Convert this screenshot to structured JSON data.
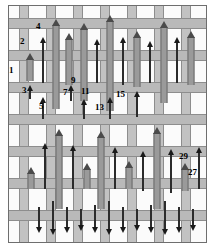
{
  "figure": {
    "title": "",
    "type": "patent-drawing",
    "canvas": {
      "width": 213,
      "height": 246
    },
    "colors": {
      "background": "#ffffff",
      "plate": "#f2f2f2",
      "cell": "#fbfbfb",
      "horizontal_band": "#b9b9b9",
      "vertical_band": "#c2c2c2",
      "band_outline": "#8d8d8d",
      "arrow_dark": "#2b2b2b",
      "arrow_tube": "#9a9a9a",
      "label_text": "#000000",
      "frame": "#6e6e6e"
    }
  },
  "grid": {
    "horizontal_band_tops": [
      12,
      44,
      76,
      108,
      140,
      172,
      204
    ],
    "horizontal_band_height": 11,
    "vertical_band_lefts": [
      10,
      37,
      64,
      91,
      118,
      145,
      172
    ],
    "vertical_band_width": 10
  },
  "arrows": [
    {
      "id": "a1",
      "x": 21,
      "top": 52,
      "height": 28,
      "style": "tube"
    },
    {
      "id": "a2",
      "x": 34,
      "top": 36,
      "height": 46,
      "style": "dark"
    },
    {
      "id": "a3",
      "x": 21,
      "top": 84,
      "height": 14,
      "style": "dark"
    },
    {
      "id": "a4",
      "x": 47,
      "top": 18,
      "height": 90,
      "style": "tube"
    },
    {
      "id": "a5",
      "x": 34,
      "top": 96,
      "height": 22,
      "style": "dark"
    },
    {
      "id": "a6",
      "x": 60,
      "top": 32,
      "height": 52,
      "style": "tube"
    },
    {
      "id": "a7",
      "x": 62,
      "top": 84,
      "height": 16,
      "style": "dark"
    },
    {
      "id": "a8",
      "x": 75,
      "top": 22,
      "height": 78,
      "style": "tube"
    },
    {
      "id": "a9",
      "x": 88,
      "top": 38,
      "height": 44,
      "style": "dark"
    },
    {
      "id": "a10",
      "x": 75,
      "top": 98,
      "height": 20,
      "style": "dark"
    },
    {
      "id": "a11",
      "x": 101,
      "top": 14,
      "height": 96,
      "style": "tube"
    },
    {
      "id": "a12",
      "x": 114,
      "top": 36,
      "height": 48,
      "style": "dark"
    },
    {
      "id": "a13",
      "x": 101,
      "top": 96,
      "height": 22,
      "style": "dark"
    },
    {
      "id": "a14",
      "x": 128,
      "top": 30,
      "height": 56,
      "style": "tube"
    },
    {
      "id": "a15",
      "x": 141,
      "top": 40,
      "height": 42,
      "style": "dark"
    },
    {
      "id": "a16",
      "x": 128,
      "top": 90,
      "height": 26,
      "style": "dark"
    },
    {
      "id": "a17",
      "x": 155,
      "top": 20,
      "height": 82,
      "style": "tube"
    },
    {
      "id": "a18",
      "x": 168,
      "top": 36,
      "height": 46,
      "style": "dark"
    },
    {
      "id": "a19",
      "x": 182,
      "top": 30,
      "height": 54,
      "style": "tube"
    },
    {
      "id": "a20",
      "x": 22,
      "top": 166,
      "height": 22,
      "style": "tube"
    },
    {
      "id": "a21",
      "x": 36,
      "top": 142,
      "height": 46,
      "style": "dark"
    },
    {
      "id": "a22",
      "x": 50,
      "top": 128,
      "height": 80,
      "style": "tube"
    },
    {
      "id": "a23",
      "x": 64,
      "top": 144,
      "height": 44,
      "style": "dark"
    },
    {
      "id": "a24",
      "x": 78,
      "top": 162,
      "height": 26,
      "style": "tube"
    },
    {
      "id": "a25",
      "x": 92,
      "top": 130,
      "height": 78,
      "style": "tube"
    },
    {
      "id": "a26",
      "x": 106,
      "top": 146,
      "height": 42,
      "style": "dark"
    },
    {
      "id": "a27",
      "x": 120,
      "top": 160,
      "height": 28,
      "style": "tube"
    },
    {
      "id": "a28",
      "x": 134,
      "top": 150,
      "height": 40,
      "style": "dark"
    },
    {
      "id": "a29",
      "x": 148,
      "top": 126,
      "height": 82,
      "style": "tube"
    },
    {
      "id": "a30",
      "x": 162,
      "top": 148,
      "height": 44,
      "style": "dark"
    },
    {
      "id": "a31",
      "x": 176,
      "top": 162,
      "height": 28,
      "style": "tube"
    },
    {
      "id": "a32",
      "x": 190,
      "top": 146,
      "height": 42,
      "style": "dark"
    }
  ],
  "down_arrows": [
    {
      "id": "d1",
      "x": 30,
      "top": 206,
      "height": 26
    },
    {
      "id": "d2",
      "x": 44,
      "top": 200,
      "height": 34
    },
    {
      "id": "d3",
      "x": 58,
      "top": 206,
      "height": 26
    },
    {
      "id": "d4",
      "x": 72,
      "top": 208,
      "height": 22
    },
    {
      "id": "d5",
      "x": 86,
      "top": 204,
      "height": 28
    },
    {
      "id": "d6",
      "x": 100,
      "top": 200,
      "height": 34
    },
    {
      "id": "d7",
      "x": 114,
      "top": 206,
      "height": 26
    },
    {
      "id": "d8",
      "x": 128,
      "top": 208,
      "height": 22
    },
    {
      "id": "d9",
      "x": 142,
      "top": 204,
      "height": 28
    },
    {
      "id": "d10",
      "x": 156,
      "top": 200,
      "height": 34
    },
    {
      "id": "d11",
      "x": 170,
      "top": 206,
      "height": 26
    },
    {
      "id": "d12",
      "x": 184,
      "top": 208,
      "height": 22
    }
  ],
  "callouts": [
    {
      "id": "c1",
      "text": "1",
      "x": 9,
      "y": 66
    },
    {
      "id": "c2",
      "text": "2",
      "x": 20,
      "y": 37
    },
    {
      "id": "c3",
      "text": "3",
      "x": 22,
      "y": 86
    },
    {
      "id": "c4",
      "text": "4",
      "x": 36,
      "y": 22
    },
    {
      "id": "c5",
      "text": "5",
      "x": 39,
      "y": 102
    },
    {
      "id": "c7",
      "text": "7",
      "x": 63,
      "y": 88
    },
    {
      "id": "c9",
      "text": "9",
      "x": 71,
      "y": 76
    },
    {
      "id": "c11",
      "text": "11",
      "x": 81,
      "y": 87
    },
    {
      "id": "c13",
      "text": "13",
      "x": 95,
      "y": 103
    },
    {
      "id": "c15",
      "text": "15",
      "x": 116,
      "y": 90
    },
    {
      "id": "c27",
      "text": "27",
      "x": 188,
      "y": 168
    },
    {
      "id": "c29",
      "text": "29",
      "x": 179,
      "y": 152
    }
  ]
}
